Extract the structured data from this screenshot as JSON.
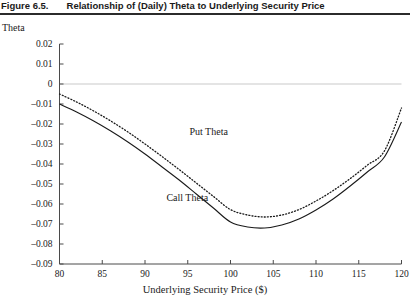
{
  "figure": {
    "number": "Figure 6.5.",
    "title": "Relationship of (Daily) Theta to Underlying Security Price"
  },
  "chart_data": {
    "type": "line",
    "title": "Relationship of (Daily) Theta to Underlying Security Price",
    "xlabel": "Underlying Security Price ($)",
    "ylabel": "Theta",
    "xlim": [
      80,
      120
    ],
    "ylim": [
      -0.09,
      0.02
    ],
    "xticks": [
      80,
      85,
      90,
      95,
      100,
      105,
      110,
      115,
      120
    ],
    "yticks": [
      0.02,
      0.01,
      0,
      -0.01,
      -0.02,
      -0.03,
      -0.04,
      -0.05,
      -0.06,
      -0.07,
      -0.08,
      -0.09
    ],
    "ytick_labels": [
      "0.02",
      "0.01",
      "0",
      "–0.01",
      "–0.02",
      "–0.03",
      "–0.04",
      "–0.05",
      "–0.06",
      "–0.07",
      "–0.08",
      "–0.09"
    ],
    "xtick_labels": [
      "80",
      "85",
      "90",
      "95",
      "100",
      "105",
      "110",
      "115",
      "120"
    ],
    "grid": false,
    "zero_reference_line": true,
    "legend_position": "inline-annotation",
    "x": [
      80,
      82,
      84,
      86,
      88,
      90,
      92,
      94,
      96,
      98,
      100,
      102,
      104,
      106,
      108,
      110,
      112,
      114,
      116,
      118,
      120
    ],
    "series": [
      {
        "name": "Call Theta",
        "style": "solid",
        "color": "#1a1a1a",
        "label_x": 92.5,
        "label_y": -0.0585,
        "values": [
          -0.01,
          -0.014,
          -0.0185,
          -0.0235,
          -0.029,
          -0.035,
          -0.0415,
          -0.048,
          -0.055,
          -0.062,
          -0.069,
          -0.0715,
          -0.072,
          -0.0705,
          -0.0675,
          -0.063,
          -0.0575,
          -0.051,
          -0.044,
          -0.0365,
          -0.019
        ]
      },
      {
        "name": "Put Theta",
        "style": "dotted",
        "color": "#1a1a1a",
        "label_x": 95.2,
        "label_y": -0.0255,
        "values": [
          -0.005,
          -0.009,
          -0.0135,
          -0.0185,
          -0.024,
          -0.03,
          -0.0363,
          -0.0428,
          -0.0495,
          -0.0562,
          -0.0628,
          -0.0655,
          -0.0665,
          -0.0655,
          -0.0628,
          -0.0585,
          -0.0533,
          -0.0473,
          -0.0406,
          -0.0335,
          -0.012
        ]
      }
    ],
    "annotations": [
      {
        "text": "Put Theta",
        "x": 95.2,
        "y": -0.0255
      },
      {
        "text": "Call Theta",
        "x": 92.5,
        "y": -0.0585
      }
    ]
  }
}
